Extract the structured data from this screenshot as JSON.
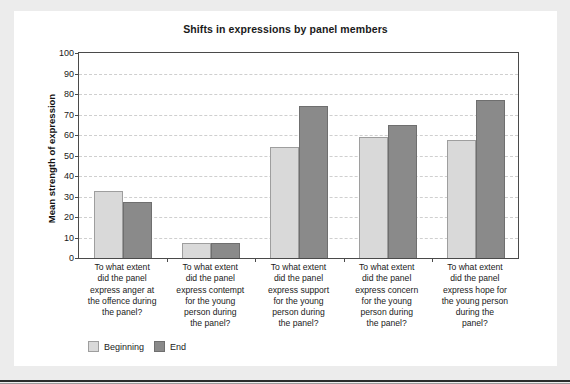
{
  "page": {
    "background_color": "#ececec",
    "card_background": "#ffffff"
  },
  "chart_data": {
    "type": "bar",
    "title": "Shifts in expressions by panel members",
    "xlabel": "",
    "ylabel": "Mean strength of expression",
    "ylim": [
      0,
      100
    ],
    "ytick_step": 10,
    "yticks": [
      0,
      10,
      20,
      30,
      40,
      50,
      60,
      70,
      80,
      90,
      100
    ],
    "grid": true,
    "legend_position": "bottom-left",
    "categories": [
      "To what extent did the panel express anger at the offence during the panel?",
      "To what extent did the panel express contempt for the young person during the panel?",
      "To what extent did the panel express support for the young person during the panel?",
      "To what extent did the panel express concern for the young person during the panel?",
      "To what extent did the panel express hope for the young person during the panel?"
    ],
    "category_lines": [
      [
        "To what extent",
        "did the panel",
        "express anger at",
        "the offence during",
        "the panel?"
      ],
      [
        "To what extent",
        "did the panel",
        "express contempt",
        "for the young",
        "person during",
        "the panel?"
      ],
      [
        "To what extent",
        "did the panel",
        "express support",
        "for the young",
        "person during",
        "the panel?"
      ],
      [
        "To what extent",
        "did the panel",
        "express concern",
        "for the young",
        "person during",
        "the panel?"
      ],
      [
        "To what extent",
        "did the panel",
        "express hope for",
        "the young person",
        "during the",
        "panel?"
      ]
    ],
    "series": [
      {
        "name": "Beginning",
        "color": "#d9d9d9",
        "values": [
          32.5,
          7.5,
          54,
          59,
          57.5
        ]
      },
      {
        "name": "End",
        "color": "#8a8a8a",
        "values": [
          27.5,
          7.5,
          74,
          65,
          77
        ]
      }
    ]
  }
}
